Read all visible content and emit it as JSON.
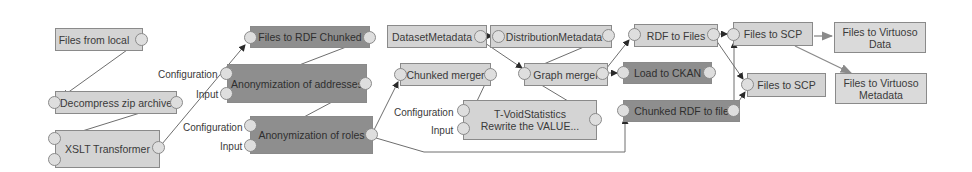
{
  "diagram": {
    "type": "pipeline-editor",
    "colors": {
      "node_light": "#d4d4d4",
      "node_dark": "#8e8e8e",
      "edge": "#6e6e6e",
      "port": "#dedede"
    },
    "nodes": [
      {
        "id": "files_from_local",
        "label": "Files from local",
        "style": "light"
      },
      {
        "id": "decompress_zip",
        "label": "Decompress zip archive",
        "style": "light"
      },
      {
        "id": "xslt",
        "label": "XSLT Transformer",
        "style": "light"
      },
      {
        "id": "files_to_rdf_chunked",
        "label": "Files to RDF Chunked",
        "style": "dark"
      },
      {
        "id": "anon_addresses",
        "label": "Anonymization of addresses",
        "style": "dark"
      },
      {
        "id": "anon_roles",
        "label": "Anonymization of roles",
        "style": "dark"
      },
      {
        "id": "dataset_metadata",
        "label": "DatasetMetadata",
        "style": "light"
      },
      {
        "id": "distribution_metadata",
        "label": "DistributionMetadata",
        "style": "light"
      },
      {
        "id": "chunked_merger",
        "label": "Chunked merger",
        "style": "light"
      },
      {
        "id": "tvoid",
        "label": "T-VoidStatistics",
        "label2": "Rewrite the VALUE...",
        "style": "light"
      },
      {
        "id": "graph_merger",
        "label": "Graph merger",
        "style": "light"
      },
      {
        "id": "rdf_to_files",
        "label": "RDF to Files",
        "style": "light"
      },
      {
        "id": "load_ckan",
        "label": "Load to CKAN",
        "style": "dark"
      },
      {
        "id": "chunked_rdf_to_file",
        "label": "Chunked RDF to file",
        "style": "dark"
      },
      {
        "id": "files_to_scp_1",
        "label": "Files to SCP",
        "style": "light"
      },
      {
        "id": "files_to_scp_2",
        "label": "Files to SCP",
        "style": "light"
      },
      {
        "id": "files_to_virtuoso_data",
        "label": "Files to Virtuoso",
        "label2": "Data",
        "style": "plain"
      },
      {
        "id": "files_to_virtuoso_metadata",
        "label": "Files to Virtuoso",
        "label2": "Metadata",
        "style": "plain"
      }
    ],
    "port_labels": {
      "configuration": "Configuration",
      "input": "Input"
    },
    "edges": [
      [
        "files_from_local",
        "decompress_zip"
      ],
      [
        "decompress_zip",
        "xslt"
      ],
      [
        "xslt",
        "files_to_rdf_chunked"
      ],
      [
        "files_to_rdf_chunked",
        "anon_addresses"
      ],
      [
        "anon_addresses",
        "anon_roles"
      ],
      [
        "anon_roles",
        "chunked_merger"
      ],
      [
        "anon_roles",
        "chunked_rdf_to_file"
      ],
      [
        "chunked_merger",
        "tvoid"
      ],
      [
        "dataset_metadata",
        "distribution_metadata"
      ],
      [
        "dataset_metadata",
        "graph_merger"
      ],
      [
        "distribution_metadata",
        "graph_merger"
      ],
      [
        "tvoid",
        "graph_merger"
      ],
      [
        "graph_merger",
        "rdf_to_files"
      ],
      [
        "graph_merger",
        "load_ckan"
      ],
      [
        "rdf_to_files",
        "files_to_scp_1"
      ],
      [
        "rdf_to_files",
        "files_to_scp_2"
      ],
      [
        "chunked_rdf_to_file",
        "files_to_scp_1"
      ],
      [
        "chunked_rdf_to_file",
        "files_to_scp_2"
      ],
      [
        "files_to_scp_1",
        "files_to_virtuoso_data"
      ],
      [
        "files_to_scp_1",
        "files_to_virtuoso_metadata"
      ]
    ]
  }
}
